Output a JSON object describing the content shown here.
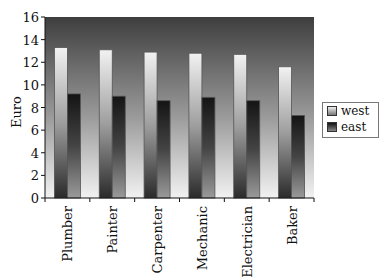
{
  "chart_data": {
    "type": "bar",
    "title": "",
    "xlabel": "",
    "ylabel": "Euro",
    "ylim": [
      0,
      16
    ],
    "yticks": [
      0,
      2,
      4,
      6,
      8,
      10,
      12,
      14,
      16
    ],
    "grid": false,
    "legend_position": "right",
    "categories": [
      "Plumber",
      "Painter",
      "Carpenter",
      "Mechanic",
      "Electrician",
      "Baker"
    ],
    "series": [
      {
        "name": "west",
        "values": [
          13.3,
          13.1,
          12.9,
          12.8,
          12.7,
          11.6
        ]
      },
      {
        "name": "east",
        "values": [
          9.2,
          9.0,
          8.6,
          8.9,
          8.6,
          7.3
        ]
      }
    ]
  },
  "legend": {
    "west": "west",
    "east": "east"
  },
  "axis": {
    "ylabel": "Euro"
  }
}
